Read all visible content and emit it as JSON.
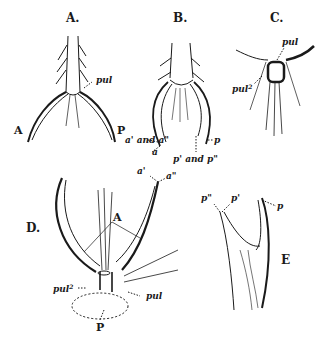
{
  "figure": {
    "panels": [
      {
        "id": "A",
        "title": "A.",
        "labels": {
          "pul": "pul",
          "left": "A",
          "right": "P"
        }
      },
      {
        "id": "B",
        "title": "B.",
        "labels": {
          "a_pair": "a' and a\"",
          "a": "a",
          "p_pair": "p' and p\"",
          "p": "p"
        }
      },
      {
        "id": "C",
        "title": "C.",
        "labels": {
          "pul": "pul",
          "pul2": "pul",
          "pul2_sup": "2"
        }
      },
      {
        "id": "D",
        "title": "D.",
        "labels": {
          "a1": "a'",
          "a2": "a\"",
          "A": "A",
          "pul2": "pul",
          "pul2_sup": "2",
          "pul": "pul",
          "P": "P"
        }
      },
      {
        "id": "E",
        "title": "E",
        "labels": {
          "p2": "p\"",
          "p1": "p'",
          "p": "p"
        }
      }
    ],
    "colors": {
      "ink": "#1a1a1a",
      "background": "#ffffff",
      "shade": "#555555"
    }
  }
}
